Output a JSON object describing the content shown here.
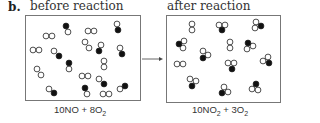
{
  "figure_label": "b.",
  "panels": [
    {
      "title": "before reaction",
      "equation_coef1": "10NO",
      "equation_plus": " + ",
      "equation_coef2": "8O",
      "equation_sub2": "2",
      "box": {
        "x": 25.5,
        "y": 15.5,
        "w": 115,
        "h": 85
      }
    },
    {
      "title": "after reaction",
      "equation_coef1": "10NO",
      "equation_sub1": "2",
      "equation_plus": " + ",
      "equation_coef2": "3O",
      "equation_sub2": "2",
      "box": {
        "x": 166.5,
        "y": 15.5,
        "w": 114,
        "h": 87
      }
    }
  ],
  "arrow": {
    "x1": 142,
    "y1": 59,
    "x2": 163,
    "y2": 59
  },
  "colors": {
    "line": "#777777",
    "atom_stroke": "#222222",
    "nitrogen": "#111111",
    "oxygen": "#ffffff"
  },
  "legend_semantics": {
    "filled_circle": "nitrogen atom",
    "open_circle": "oxygen atom"
  },
  "molecules_before": [
    {
      "type": "O2",
      "atoms": [
        [
          46,
          36,
          "o"
        ],
        [
          52,
          36,
          "o"
        ]
      ]
    },
    {
      "type": "NO",
      "atoms": [
        [
          66,
          26,
          "n"
        ],
        [
          68,
          32,
          "o"
        ]
      ]
    },
    {
      "type": "O2",
      "atoms": [
        [
          88,
          31,
          "o"
        ],
        [
          94,
          31,
          "o"
        ]
      ]
    },
    {
      "type": "NO",
      "atoms": [
        [
          117,
          24,
          "o"
        ],
        [
          118,
          30,
          "n"
        ]
      ]
    },
    {
      "type": "O2",
      "atoms": [
        [
          33,
          50,
          "o"
        ],
        [
          39,
          50,
          "o"
        ]
      ]
    },
    {
      "type": "NO",
      "atoms": [
        [
          54,
          51,
          "o"
        ],
        [
          59,
          56,
          "n"
        ]
      ]
    },
    {
      "type": "O2",
      "atoms": [
        [
          85,
          42,
          "o"
        ],
        [
          89,
          48,
          "o"
        ]
      ]
    },
    {
      "type": "NO",
      "atoms": [
        [
          101,
          45,
          "o"
        ],
        [
          99,
          51,
          "n"
        ]
      ]
    },
    {
      "type": "NO",
      "atoms": [
        [
          120,
          48,
          "o"
        ],
        [
          122,
          54,
          "n"
        ]
      ]
    },
    {
      "type": "NO",
      "atoms": [
        [
          69,
          63,
          "n"
        ],
        [
          69,
          69,
          "o"
        ]
      ]
    },
    {
      "type": "O2",
      "atoms": [
        [
          104,
          61,
          "o"
        ],
        [
          104,
          67,
          "o"
        ]
      ]
    },
    {
      "type": "O2",
      "atoms": [
        [
          37,
          69,
          "o"
        ],
        [
          41,
          75,
          "o"
        ]
      ]
    },
    {
      "type": "O2",
      "atoms": [
        [
          82,
          76,
          "o"
        ],
        [
          88,
          76,
          "o"
        ]
      ]
    },
    {
      "type": "NO",
      "atoms": [
        [
          99,
          79,
          "o"
        ],
        [
          104,
          84,
          "n"
        ]
      ]
    },
    {
      "type": "NO",
      "atoms": [
        [
          49,
          89,
          "o"
        ],
        [
          54,
          93,
          "n"
        ]
      ]
    },
    {
      "type": "NO",
      "atoms": [
        [
          85,
          88,
          "n"
        ],
        [
          87,
          94,
          "o"
        ]
      ]
    },
    {
      "type": "O2",
      "atoms": [
        [
          103,
          94,
          "o"
        ],
        [
          109,
          94,
          "o"
        ]
      ]
    },
    {
      "type": "NO",
      "atoms": [
        [
          120,
          89,
          "o"
        ],
        [
          125,
          86,
          "n"
        ]
      ]
    }
  ],
  "molecules_after": [
    {
      "type": "O2",
      "atoms": [
        [
          192,
          24,
          "o"
        ],
        [
          192,
          30,
          "o"
        ]
      ]
    },
    {
      "type": "NO2",
      "atoms": [
        [
          219,
          25,
          "o"
        ],
        [
          225,
          25,
          "o"
        ],
        [
          222,
          30,
          "n"
        ]
      ]
    },
    {
      "type": "NO2",
      "atoms": [
        [
          256,
          22,
          "o"
        ],
        [
          255,
          28,
          "o"
        ],
        [
          261,
          26,
          "n"
        ]
      ]
    },
    {
      "type": "NO2",
      "atoms": [
        [
          179,
          44,
          "n"
        ],
        [
          184,
          41,
          "o"
        ],
        [
          183,
          48,
          "o"
        ]
      ]
    },
    {
      "type": "O2",
      "atoms": [
        [
          230,
          42,
          "o"
        ],
        [
          230,
          48,
          "o"
        ]
      ]
    },
    {
      "type": "NO2",
      "atoms": [
        [
          248,
          43,
          "n"
        ],
        [
          253,
          46,
          "o"
        ],
        [
          247,
          49,
          "o"
        ]
      ]
    },
    {
      "type": "NO2",
      "atoms": [
        [
          203,
          51,
          "o"
        ],
        [
          208,
          55,
          "o"
        ],
        [
          203,
          58,
          "n"
        ]
      ]
    },
    {
      "type": "NO2",
      "atoms": [
        [
          268,
          57,
          "o"
        ],
        [
          263,
          61,
          "o"
        ],
        [
          269,
          63,
          "n"
        ]
      ]
    },
    {
      "type": "O2",
      "atoms": [
        [
          177,
          64,
          "o"
        ],
        [
          183,
          64,
          "o"
        ]
      ]
    },
    {
      "type": "NO2",
      "atoms": [
        [
          228,
          63,
          "o"
        ],
        [
          234,
          63,
          "o"
        ],
        [
          232,
          69,
          "n"
        ]
      ]
    },
    {
      "type": "NO2",
      "atoms": [
        [
          190,
          79,
          "o"
        ],
        [
          196,
          81,
          "o"
        ],
        [
          192,
          86,
          "n"
        ]
      ]
    },
    {
      "type": "NO2",
      "atoms": [
        [
          224,
          87,
          "o"
        ],
        [
          222,
          93,
          "n"
        ],
        [
          228,
          92,
          "o"
        ]
      ]
    },
    {
      "type": "NO2",
      "atoms": [
        [
          256,
          84,
          "n"
        ],
        [
          252,
          89,
          "o"
        ],
        [
          258,
          90,
          "o"
        ]
      ]
    }
  ]
}
